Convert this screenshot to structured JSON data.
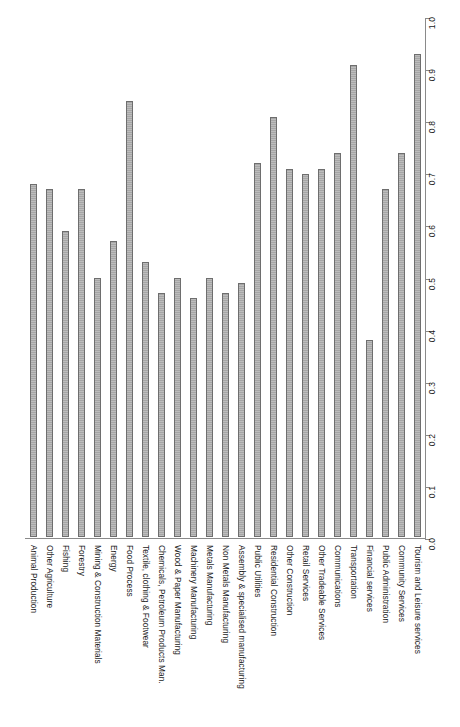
{
  "chart_data": {
    "type": "bar",
    "title": "",
    "subtitle": "",
    "xlabel": "",
    "ylabel": "",
    "orientation": "vertical-bars-rotated-labels",
    "grid": false,
    "legend": null,
    "ylim": [
      0.0,
      1.0
    ],
    "tick_labels": [
      "0.0",
      "0.1",
      "0.2",
      "0.3",
      "0.4",
      "0.5",
      "0.6",
      "0.7",
      "0.8",
      "0.9",
      "1.0"
    ],
    "tick_values": [
      0.0,
      0.1,
      0.2,
      0.3,
      0.4,
      0.5,
      0.6,
      0.7,
      0.8,
      0.9,
      1.0
    ],
    "categories": [
      "Animal Production",
      "Other Agriculture",
      "Fishing",
      "Forestry",
      "Mining & Construction Materials",
      "Energy",
      "Food Process",
      "Textile, clothing & Footwear",
      "Chemicals, Petroleum Products Man.",
      "Wood & Paper Manufacturing",
      "Machinery Manufacturing",
      "Metals Manufacturing",
      "Non Metals Manufacturing",
      "Assembly & specialised manufacturing",
      "Public Utilities",
      "Residential Construction",
      "Other Construction",
      "Retail Services",
      "Other Tradeable Services",
      "Communications",
      "Transportation",
      "Financial services",
      "Public Administration",
      "Community Services",
      "Tourism and Leisure services"
    ],
    "values": [
      0.68,
      0.67,
      0.59,
      0.67,
      0.5,
      0.57,
      0.84,
      0.53,
      0.47,
      0.5,
      0.46,
      0.5,
      0.47,
      0.49,
      0.72,
      0.81,
      0.71,
      0.7,
      0.71,
      0.74,
      0.91,
      0.38,
      0.67,
      0.74,
      0.93
    ],
    "bar_fill_color": "#b0b0b0",
    "bar_edge_color": "#6e6e6e",
    "axis_color": "#8a8a8a",
    "background_color": "#ffffff"
  }
}
